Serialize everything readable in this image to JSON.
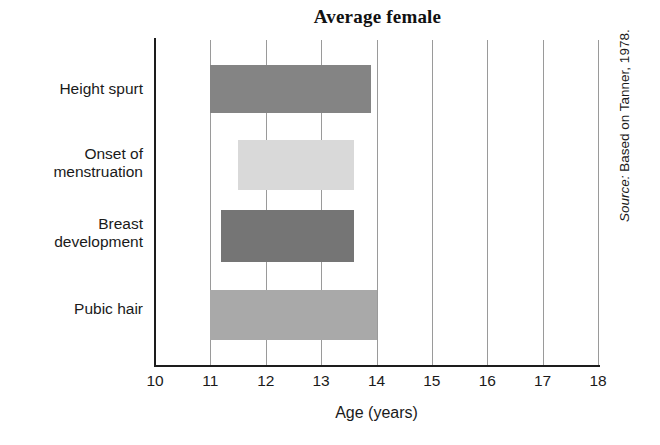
{
  "chart_data": {
    "type": "bar",
    "orientation": "horizontal",
    "title": "Average female",
    "xlabel": "Age (years)",
    "ylabel": "",
    "xlim": [
      10,
      18
    ],
    "xticks": [
      10,
      11,
      12,
      13,
      14,
      15,
      16,
      17,
      18
    ],
    "xtick_labels": [
      "10",
      "11",
      "12",
      "13",
      "14",
      "15",
      "16",
      "17",
      "18"
    ],
    "grid": "vertical",
    "legend": "none",
    "categories": [
      "Height spurt",
      "Onset of menstruation",
      "Breast development",
      "Pubic hair"
    ],
    "category_label_lines": [
      [
        "Height spurt"
      ],
      [
        "Onset of",
        "menstruation"
      ],
      [
        "Breast",
        "development"
      ],
      [
        "Pubic hair"
      ]
    ],
    "bars": [
      {
        "category": "Height spurt",
        "start": 11.0,
        "end": 13.9,
        "color": "#848484"
      },
      {
        "category": "Onset of menstruation",
        "start": 11.5,
        "end": 13.6,
        "color": "#d9d9d9"
      },
      {
        "category": "Breast development",
        "start": 11.2,
        "end": 13.6,
        "color": "#757575"
      },
      {
        "category": "Pubic hair",
        "start": 11.0,
        "end": 14.0,
        "color": "#a9a9a9"
      }
    ],
    "annotations": [
      "Source: Based on Tanner, 1978."
    ]
  },
  "source": {
    "prefix": "Source:",
    "text": " Based on Tanner, 1978."
  },
  "colors": {
    "axis": "#1d1d1d",
    "gridline": "#9a9a9a",
    "text": "#1a1a1a",
    "background": "#ffffff"
  }
}
